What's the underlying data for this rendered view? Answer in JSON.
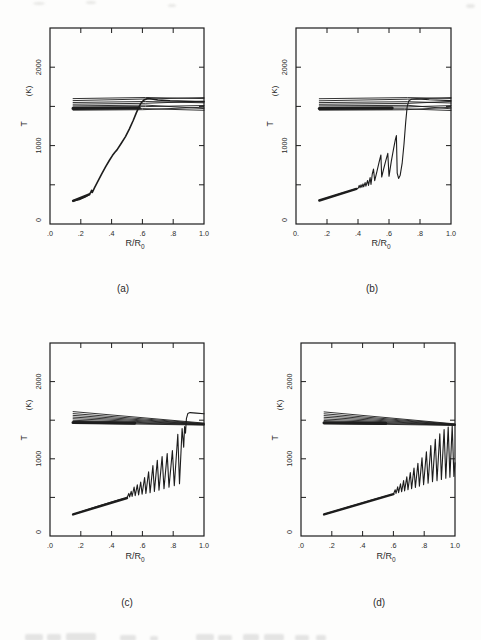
{
  "page": {
    "background": "#fdfdfc",
    "line_color": "#1d1d1d",
    "text_color": "#2a2a2a"
  },
  "chart_data": [
    {
      "panel": "a",
      "panel_label": "(a)",
      "type": "line",
      "xlabel_main": "R/R",
      "xlabel_sub": "0",
      "ylabel": "T",
      "yunit": "(K)",
      "xlim": [
        0,
        1.0
      ],
      "ylim": [
        0,
        2500
      ],
      "xtick_values": [
        0,
        0.2,
        0.4,
        0.6,
        0.8,
        1.0
      ],
      "xtick_labels": [
        ".0",
        ".2",
        ".4",
        ".6",
        ".8",
        "1.0"
      ],
      "xticks_drawn": [
        0.2,
        0.4,
        0.6,
        0.8
      ],
      "ytick_values": [
        0,
        1000,
        2000
      ],
      "ytick_labels": [
        "0",
        "1000",
        "2000"
      ],
      "yticks_drawn": [
        500,
        1000,
        1500,
        2000
      ],
      "envelope": [
        [
          [
            0.15,
            1600
          ],
          [
            0.62,
            1614
          ],
          [
            1.0,
            1600
          ]
        ],
        [
          [
            0.15,
            1574
          ],
          [
            0.62,
            1594
          ],
          [
            1.0,
            1612
          ]
        ],
        [
          [
            0.15,
            1550
          ],
          [
            0.62,
            1562
          ],
          [
            1.0,
            1546
          ]
        ],
        [
          [
            0.15,
            1528
          ],
          [
            0.62,
            1540
          ],
          [
            1.0,
            1566
          ]
        ],
        [
          [
            0.15,
            1507
          ],
          [
            0.62,
            1517
          ],
          [
            1.0,
            1472
          ]
        ],
        [
          [
            0.15,
            1489
          ],
          [
            0.62,
            1497
          ],
          [
            1.0,
            1512
          ]
        ],
        [
          [
            0.15,
            1470
          ],
          [
            0.6,
            1472
          ],
          [
            1.0,
            1450
          ]
        ],
        [
          [
            0.15,
            1452
          ],
          [
            0.6,
            1458
          ],
          [
            1.0,
            1490
          ]
        ]
      ],
      "envelope_thick": [
        [
          0.15,
          1474
        ],
        [
          0.58,
          1480
        ]
      ],
      "base": [
        [
          0.15,
          295
        ],
        [
          0.255,
          378
        ]
      ],
      "main": [
        [
          0.15,
          295
        ],
        [
          0.19,
          312
        ],
        [
          0.23,
          348
        ],
        [
          0.255,
          378
        ],
        [
          0.265,
          405
        ],
        [
          0.27,
          430
        ],
        [
          0.275,
          402
        ],
        [
          0.29,
          468
        ],
        [
          0.31,
          540
        ],
        [
          0.335,
          635
        ],
        [
          0.36,
          725
        ],
        [
          0.385,
          810
        ],
        [
          0.405,
          872
        ],
        [
          0.42,
          912
        ],
        [
          0.435,
          945
        ],
        [
          0.46,
          1020
        ],
        [
          0.49,
          1115
        ],
        [
          0.515,
          1210
        ],
        [
          0.54,
          1320
        ],
        [
          0.56,
          1415
        ],
        [
          0.575,
          1485
        ],
        [
          0.59,
          1540
        ],
        [
          0.61,
          1582
        ],
        [
          0.635,
          1602
        ],
        [
          0.66,
          1595
        ],
        [
          0.7,
          1582
        ],
        [
          0.78,
          1572
        ],
        [
          0.88,
          1565
        ],
        [
          1.0,
          1560
        ]
      ],
      "main_width": 1.6
    },
    {
      "panel": "b",
      "panel_label": "(b)",
      "type": "line",
      "xlabel_main": "R/R",
      "xlabel_sub": "0",
      "ylabel": "T",
      "yunit": "(K)",
      "xlim": [
        0,
        1.0
      ],
      "ylim": [
        0,
        2500
      ],
      "xtick_values": [
        0,
        0.2,
        0.4,
        0.6,
        0.8,
        1.0
      ],
      "xtick_labels": [
        "0.",
        ".2",
        ".4",
        ".6",
        ".8",
        "1.0"
      ],
      "xticks_drawn": [
        0.2,
        0.4,
        0.6,
        0.8
      ],
      "ytick_values": [
        0,
        1000,
        2000
      ],
      "ytick_labels": [
        "0",
        "1000",
        "2000"
      ],
      "yticks_drawn": [
        500,
        1000,
        1500,
        2000
      ],
      "envelope": [
        [
          [
            0.15,
            1598
          ],
          [
            0.72,
            1612
          ],
          [
            1.0,
            1602
          ]
        ],
        [
          [
            0.15,
            1572
          ],
          [
            0.72,
            1592
          ],
          [
            1.0,
            1612
          ]
        ],
        [
          [
            0.15,
            1549
          ],
          [
            0.72,
            1560
          ],
          [
            1.0,
            1544
          ]
        ],
        [
          [
            0.15,
            1527
          ],
          [
            0.72,
            1538
          ],
          [
            1.0,
            1564
          ]
        ],
        [
          [
            0.15,
            1506
          ],
          [
            0.72,
            1514
          ],
          [
            1.0,
            1470
          ]
        ],
        [
          [
            0.15,
            1488
          ],
          [
            0.72,
            1494
          ],
          [
            1.0,
            1510
          ]
        ],
        [
          [
            0.15,
            1469
          ],
          [
            0.7,
            1470
          ],
          [
            1.0,
            1448
          ]
        ],
        [
          [
            0.15,
            1452
          ],
          [
            0.7,
            1456
          ],
          [
            1.0,
            1488
          ]
        ]
      ],
      "envelope_thick": [
        [
          0.15,
          1473
        ],
        [
          0.62,
          1478
        ]
      ],
      "base": [
        [
          0.15,
          300
        ],
        [
          0.39,
          448
        ]
      ],
      "main": [
        [
          0.15,
          300
        ],
        [
          0.2,
          332
        ],
        [
          0.25,
          362
        ],
        [
          0.3,
          394
        ],
        [
          0.35,
          424
        ],
        [
          0.39,
          448
        ],
        [
          0.402,
          458
        ],
        [
          0.408,
          492
        ],
        [
          0.413,
          462
        ],
        [
          0.42,
          500
        ],
        [
          0.425,
          468
        ],
        [
          0.432,
          512
        ],
        [
          0.437,
          474
        ],
        [
          0.446,
          528
        ],
        [
          0.451,
          482
        ],
        [
          0.462,
          555
        ],
        [
          0.468,
          492
        ],
        [
          0.478,
          592
        ],
        [
          0.484,
          505
        ],
        [
          0.492,
          640
        ],
        [
          0.5,
          700
        ],
        [
          0.508,
          552
        ],
        [
          0.522,
          668
        ],
        [
          0.536,
          790
        ],
        [
          0.548,
          880
        ],
        [
          0.553,
          600
        ],
        [
          0.565,
          700
        ],
        [
          0.578,
          800
        ],
        [
          0.592,
          902
        ],
        [
          0.6,
          608
        ],
        [
          0.615,
          800
        ],
        [
          0.63,
          960
        ],
        [
          0.641,
          1080
        ],
        [
          0.648,
          1128
        ],
        [
          0.653,
          648
        ],
        [
          0.662,
          582
        ],
        [
          0.672,
          622
        ],
        [
          0.685,
          780
        ],
        [
          0.697,
          1020
        ],
        [
          0.708,
          1300
        ],
        [
          0.717,
          1490
        ],
        [
          0.727,
          1570
        ],
        [
          0.745,
          1592
        ],
        [
          0.78,
          1596
        ],
        [
          0.86,
          1586
        ],
        [
          1.0,
          1574
        ]
      ],
      "main_width": 1.1
    },
    {
      "panel": "c",
      "panel_label": "(c)",
      "type": "line",
      "xlabel_main": "R/R",
      "xlabel_sub": "0",
      "ylabel": "T",
      "yunit": "(K)",
      "xlim": [
        0,
        1.0
      ],
      "ylim": [
        0,
        2500
      ],
      "xtick_values": [
        0,
        0.2,
        0.4,
        0.6,
        0.8,
        1.0
      ],
      "xtick_labels": [
        ".0",
        ".2",
        ".4",
        ".6",
        ".8",
        "1.0"
      ],
      "xticks_drawn": [
        0.2,
        0.4,
        0.6,
        0.8
      ],
      "ytick_values": [
        0,
        1000,
        2000
      ],
      "ytick_labels": [
        "0",
        "1000",
        "2000"
      ],
      "yticks_drawn": [
        500,
        1000,
        1500,
        2000
      ],
      "envelope": [
        [
          [
            0.15,
            1612
          ],
          [
            1.0,
            1462
          ]
        ],
        [
          [
            0.15,
            1586
          ],
          [
            1.0,
            1457
          ]
        ],
        [
          [
            0.15,
            1562
          ],
          [
            1.0,
            1452
          ]
        ],
        [
          [
            0.15,
            1540
          ],
          [
            1.0,
            1449
          ]
        ],
        [
          [
            0.15,
            1519
          ],
          [
            1.0,
            1446
          ]
        ],
        [
          [
            0.15,
            1499
          ],
          [
            1.0,
            1443
          ]
        ],
        [
          [
            0.15,
            1480
          ],
          [
            1.0,
            1440
          ]
        ],
        [
          [
            0.15,
            1462
          ],
          [
            1.0,
            1437
          ]
        ]
      ],
      "envelope_thick": [
        [
          0.15,
          1470
        ],
        [
          0.55,
          1462
        ]
      ],
      "base": [
        [
          0.15,
          280
        ],
        [
          0.5,
          492
        ]
      ],
      "main": [
        [
          0.15,
          280
        ],
        [
          0.22,
          326
        ],
        [
          0.3,
          378
        ],
        [
          0.38,
          428
        ],
        [
          0.45,
          468
        ],
        [
          0.5,
          492
        ],
        [
          0.512,
          552
        ],
        [
          0.517,
          505
        ],
        [
          0.527,
          578
        ],
        [
          0.533,
          512
        ],
        [
          0.546,
          635
        ],
        [
          0.553,
          522
        ],
        [
          0.567,
          662
        ],
        [
          0.575,
          532
        ],
        [
          0.589,
          700
        ],
        [
          0.598,
          542
        ],
        [
          0.614,
          758
        ],
        [
          0.623,
          552
        ],
        [
          0.64,
          832
        ],
        [
          0.65,
          562
        ],
        [
          0.668,
          912
        ],
        [
          0.678,
          576
        ],
        [
          0.697,
          982
        ],
        [
          0.708,
          595
        ],
        [
          0.728,
          1028
        ],
        [
          0.74,
          612
        ],
        [
          0.761,
          1068
        ],
        [
          0.773,
          632
        ],
        [
          0.795,
          1108
        ],
        [
          0.807,
          652
        ],
        [
          0.83,
          1318
        ],
        [
          0.841,
          678
        ],
        [
          0.858,
          1392
        ],
        [
          0.868,
          1150
        ],
        [
          0.874,
          1418
        ],
        [
          0.88,
          1330
        ],
        [
          0.886,
          1520
        ],
        [
          0.895,
          1585
        ],
        [
          0.91,
          1598
        ],
        [
          0.95,
          1592
        ],
        [
          1.0,
          1584
        ]
      ],
      "main_width": 1.1
    },
    {
      "panel": "d",
      "panel_label": "(d)",
      "type": "line",
      "xlabel_main": "R/R",
      "xlabel_sub": "0",
      "ylabel": "T",
      "yunit": "(K)",
      "xlim": [
        0,
        1.0
      ],
      "ylim": [
        0,
        2500
      ],
      "xtick_values": [
        0,
        0.2,
        0.4,
        0.6,
        0.8,
        1.0
      ],
      "xtick_labels": [
        ".0",
        ".2",
        ".4",
        ".6",
        ".8",
        "1.0"
      ],
      "xticks_drawn": [
        0.2,
        0.4,
        0.6,
        0.8
      ],
      "ytick_values": [
        0,
        1000,
        2000
      ],
      "ytick_labels": [
        "0",
        "1000",
        "2000"
      ],
      "yticks_drawn": [
        500,
        1000,
        1500,
        2000
      ],
      "envelope": [
        [
          [
            0.15,
            1608
          ],
          [
            1.0,
            1452
          ]
        ],
        [
          [
            0.15,
            1583
          ],
          [
            1.0,
            1448
          ]
        ],
        [
          [
            0.15,
            1559
          ],
          [
            1.0,
            1445
          ]
        ],
        [
          [
            0.15,
            1537
          ],
          [
            1.0,
            1442
          ]
        ],
        [
          [
            0.15,
            1516
          ],
          [
            1.0,
            1440
          ]
        ],
        [
          [
            0.15,
            1496
          ],
          [
            1.0,
            1438
          ]
        ],
        [
          [
            0.15,
            1477
          ],
          [
            1.0,
            1435
          ]
        ],
        [
          [
            0.15,
            1459
          ],
          [
            1.0,
            1432
          ]
        ]
      ],
      "envelope_thick": [
        [
          0.15,
          1466
        ],
        [
          0.55,
          1458
        ]
      ],
      "base": [
        [
          0.15,
          280
        ],
        [
          0.6,
          542
        ]
      ],
      "main": [
        [
          0.15,
          280
        ],
        [
          0.22,
          322
        ],
        [
          0.3,
          370
        ],
        [
          0.38,
          418
        ],
        [
          0.46,
          466
        ],
        [
          0.54,
          512
        ],
        [
          0.6,
          542
        ],
        [
          0.612,
          598
        ],
        [
          0.617,
          552
        ],
        [
          0.628,
          636
        ],
        [
          0.634,
          562
        ],
        [
          0.646,
          676
        ],
        [
          0.653,
          572
        ],
        [
          0.666,
          718
        ],
        [
          0.673,
          584
        ],
        [
          0.687,
          766
        ],
        [
          0.695,
          598
        ],
        [
          0.71,
          822
        ],
        [
          0.718,
          612
        ],
        [
          0.734,
          880
        ],
        [
          0.743,
          628
        ],
        [
          0.759,
          942
        ],
        [
          0.769,
          646
        ],
        [
          0.786,
          1012
        ],
        [
          0.796,
          664
        ],
        [
          0.814,
          1092
        ],
        [
          0.825,
          684
        ],
        [
          0.843,
          1172
        ],
        [
          0.854,
          702
        ],
        [
          0.872,
          1252
        ],
        [
          0.883,
          718
        ],
        [
          0.901,
          1322
        ],
        [
          0.912,
          732
        ],
        [
          0.929,
          1378
        ],
        [
          0.94,
          748
        ],
        [
          0.956,
          1410
        ],
        [
          0.967,
          760
        ],
        [
          0.982,
          1428
        ],
        [
          0.993,
          772
        ],
        [
          1.0,
          950
        ]
      ],
      "main_width": 1.1
    }
  ]
}
